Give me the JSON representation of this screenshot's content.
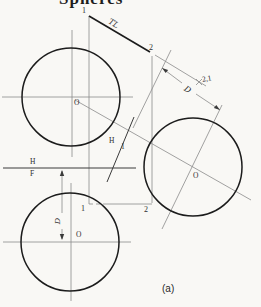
{
  "title": "Spheres",
  "caption": "(a)",
  "views": {
    "top_view": {
      "center_label": "O"
    },
    "front_view": {
      "center_label": "O",
      "point1": "1",
      "point2": "2"
    },
    "aux_view": {
      "center_label": "O"
    }
  },
  "line_labels": {
    "true_length": "TL",
    "point1": "1",
    "point2": "2"
  },
  "fold_lines": {
    "hf": {
      "top": "H",
      "bottom": "F"
    },
    "h1": {
      "left": "H",
      "right": "1"
    },
    "view21": "2,1"
  },
  "dimensions": {
    "aux_d": "D",
    "front_d": "D"
  },
  "colors": {
    "paper": "#f9f8f5",
    "line_dark": "#1c1c1c",
    "line_mid": "#3a3a3a",
    "line_gray": "#8a8a8a",
    "text": "#2e2e2e"
  }
}
